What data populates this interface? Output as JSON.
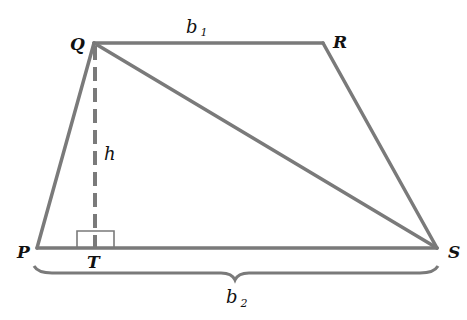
{
  "diagram": {
    "type": "trapezoid-geometry",
    "colors": {
      "line": "#7a7a7a",
      "label": "#111111",
      "background": "#ffffff"
    },
    "vertices": {
      "P": {
        "label": "P",
        "x": 37,
        "y": 248
      },
      "Q": {
        "label": "Q",
        "x": 94,
        "y": 43
      },
      "R": {
        "label": "R",
        "x": 323,
        "y": 43
      },
      "S": {
        "label": "S",
        "x": 437,
        "y": 248
      },
      "T": {
        "label": "T",
        "x": 95,
        "y": 248
      }
    },
    "labels": {
      "b1": {
        "base": "b",
        "sub": "1"
      },
      "b2": {
        "base": "b",
        "sub": "2"
      },
      "h": "h"
    },
    "segments": [
      {
        "name": "QR",
        "role": "top base b1"
      },
      {
        "name": "PS",
        "role": "bottom base b2"
      },
      {
        "name": "PQ",
        "role": "left leg"
      },
      {
        "name": "RS",
        "role": "right leg"
      },
      {
        "name": "QS",
        "role": "diagonal"
      },
      {
        "name": "QT",
        "role": "altitude h (dashed)"
      }
    ]
  }
}
